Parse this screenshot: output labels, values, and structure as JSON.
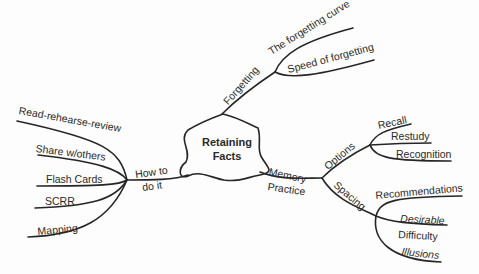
{
  "mindmap": {
    "center": {
      "line1": "Retaining",
      "line2": "Facts"
    },
    "branches": {
      "forgetting": {
        "label": "Forgetting",
        "children": [
          "The forgetting curve",
          "Speed of forgetting"
        ]
      },
      "how_to": {
        "label_line1": "How to",
        "label_line2": "do it",
        "children": [
          "Read-rehearse-review",
          "Share w/others",
          "Flash Cards",
          "SCRR",
          "Mapping"
        ]
      },
      "memory_practice": {
        "label_line1": "Memory",
        "label_line2": "Practice",
        "options": {
          "label": "Options",
          "children": [
            "Recall",
            "Restudy",
            "Recognition"
          ]
        },
        "spacing": {
          "label": "Spacing",
          "children": [
            "Recommendations",
            "Desirable",
            "Difficulty",
            "Illusions"
          ]
        }
      }
    }
  },
  "colors": {
    "ink": "#262626",
    "background": "#fdfdfd"
  }
}
